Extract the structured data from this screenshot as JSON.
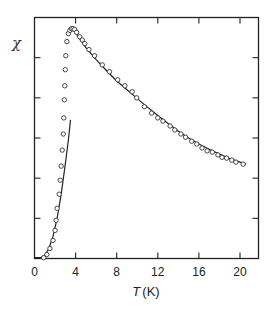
{
  "chart_data": {
    "type": "scatter",
    "title": "",
    "xlabel_italic": "T",
    "xlabel_unit": "(K)",
    "xlabel": "T (K)",
    "ylabel": "χ",
    "xlim": [
      0,
      21.8
    ],
    "ylim": [
      0,
      6.0
    ],
    "xticks": [
      0,
      4,
      8,
      12,
      16,
      20
    ],
    "xtick_labels": [
      "0",
      "4",
      "8",
      "12",
      "16",
      "20"
    ],
    "yticks": [
      1,
      2,
      3,
      4,
      5
    ],
    "ytick_labels": [],
    "grid": false,
    "legend": null,
    "series": [
      {
        "name": "measured χ (open circles)",
        "kind": "markers",
        "marker": "open-circle",
        "x": [
          0.9,
          1.2,
          1.5,
          1.8,
          2.0,
          2.1,
          2.2,
          2.4,
          2.5,
          2.6,
          2.7,
          2.8,
          2.85,
          2.9,
          2.95,
          3.0,
          3.05,
          3.15,
          3.3,
          3.45,
          3.6,
          3.75,
          3.9,
          4.1,
          4.4,
          4.65,
          4.9,
          5.3,
          5.85,
          6.6,
          7.3,
          8.1,
          8.8,
          9.5,
          9.95,
          10.7,
          11.4,
          12.0,
          12.5,
          13.2,
          13.65,
          14.25,
          14.7,
          15.3,
          15.8,
          16.3,
          16.8,
          17.3,
          17.85,
          18.25,
          18.7,
          19.2,
          19.6,
          20.3
        ],
        "y": [
          0.02,
          0.1,
          0.25,
          0.45,
          0.7,
          0.95,
          1.25,
          1.6,
          1.95,
          2.3,
          2.7,
          3.1,
          3.5,
          3.95,
          4.3,
          4.7,
          5.05,
          5.4,
          5.6,
          5.68,
          5.72,
          5.72,
          5.7,
          5.63,
          5.52,
          5.44,
          5.35,
          5.2,
          5.05,
          4.82,
          4.65,
          4.45,
          4.3,
          4.15,
          4.0,
          3.78,
          3.62,
          3.5,
          3.42,
          3.3,
          3.2,
          3.1,
          3.02,
          2.92,
          2.85,
          2.75,
          2.68,
          2.65,
          2.58,
          2.52,
          2.5,
          2.45,
          2.4,
          2.35
        ]
      },
      {
        "name": "low-T fit (solid line)",
        "kind": "line",
        "x": [
          0,
          0.6,
          1.0,
          1.4,
          1.8,
          2.2,
          2.6,
          3.0,
          3.3,
          3.5
        ],
        "y": [
          0.02,
          0.02,
          0.08,
          0.25,
          0.55,
          1.0,
          1.6,
          2.35,
          2.95,
          3.45
        ]
      },
      {
        "name": "high-T fit (solid line)",
        "kind": "line",
        "x": [
          3.45,
          3.7,
          4.2,
          5.0,
          6.0,
          7.0,
          8.0,
          9.0,
          10.0,
          11.0,
          12.0,
          13.0,
          14.0,
          15.0,
          16.0,
          17.0,
          18.0,
          19.0,
          20.0,
          20.6
        ],
        "y": [
          5.68,
          5.72,
          5.55,
          5.25,
          4.95,
          4.68,
          4.42,
          4.2,
          3.98,
          3.77,
          3.56,
          3.36,
          3.17,
          3.0,
          2.85,
          2.72,
          2.6,
          2.49,
          2.4,
          2.35
        ]
      }
    ]
  }
}
